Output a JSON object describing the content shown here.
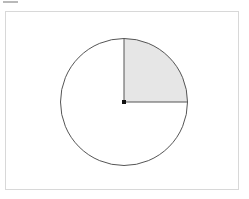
{
  "panel": {
    "background_color": "#ffffff",
    "border_color": "#d8d8d8"
  },
  "top_sliver": {
    "name": "cropped-toolbar-sliver",
    "color": "#b9b9b9"
  },
  "figure": {
    "title": "",
    "caption": "",
    "type": "geometry-diagram",
    "circle": {
      "center_x": 118,
      "center_y": 90,
      "radius": 63.5,
      "stroke_color": "#555555",
      "stroke_width": 1,
      "fill_color": "#ffffff"
    },
    "sector": {
      "label": "quarter-sector",
      "start_angle_deg": 0,
      "end_angle_deg": 90,
      "fraction": 0.25,
      "fill_color": "#e6e6e6",
      "stroke_color": "#9a9a9a"
    },
    "center_point": {
      "label": "center",
      "color": "#111111",
      "size": 4
    },
    "radii": [
      {
        "label": "vertical-radius",
        "angle_deg": 90,
        "color": "#555555"
      },
      {
        "label": "horizontal-radius",
        "angle_deg": 0,
        "color": "#555555"
      }
    ]
  }
}
